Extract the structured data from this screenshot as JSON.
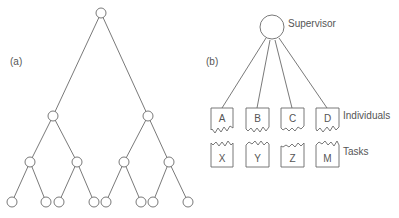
{
  "panel_a": {
    "label": "(a)",
    "nodes": [
      {
        "id": "root",
        "x": 101,
        "y": 13
      },
      {
        "id": "l2a",
        "x": 53,
        "y": 116
      },
      {
        "id": "l2b",
        "x": 148,
        "y": 116
      },
      {
        "id": "l3a",
        "x": 30,
        "y": 162
      },
      {
        "id": "l3b",
        "x": 77,
        "y": 162
      },
      {
        "id": "l3c",
        "x": 124,
        "y": 162
      },
      {
        "id": "l3d",
        "x": 169,
        "y": 162
      },
      {
        "id": "l4a",
        "x": 12,
        "y": 202
      },
      {
        "id": "l4b",
        "x": 46,
        "y": 202
      },
      {
        "id": "l4c",
        "x": 59,
        "y": 202
      },
      {
        "id": "l4d",
        "x": 94,
        "y": 202
      },
      {
        "id": "l4e",
        "x": 106,
        "y": 202
      },
      {
        "id": "l4f",
        "x": 141,
        "y": 202
      },
      {
        "id": "l4g",
        "x": 153,
        "y": 202
      },
      {
        "id": "l4h",
        "x": 188,
        "y": 202
      }
    ],
    "edges": [
      [
        "root",
        "l2a"
      ],
      [
        "root",
        "l2b"
      ],
      [
        "l2a",
        "l3a"
      ],
      [
        "l2a",
        "l3b"
      ],
      [
        "l2b",
        "l3c"
      ],
      [
        "l2b",
        "l3d"
      ],
      [
        "l3a",
        "l4a"
      ],
      [
        "l3a",
        "l4b"
      ],
      [
        "l3b",
        "l4c"
      ],
      [
        "l3b",
        "l4d"
      ],
      [
        "l3c",
        "l4e"
      ],
      [
        "l3c",
        "l4f"
      ],
      [
        "l3d",
        "l4g"
      ],
      [
        "l3d",
        "l4h"
      ]
    ]
  },
  "panel_b": {
    "label": "(b)",
    "supervisor_label": "Supervisor",
    "individuals_label": "Individuals",
    "tasks_label": "Tasks",
    "individuals": [
      "A",
      "B",
      "C",
      "D"
    ],
    "tasks": [
      "X",
      "Y",
      "Z",
      "M"
    ]
  }
}
